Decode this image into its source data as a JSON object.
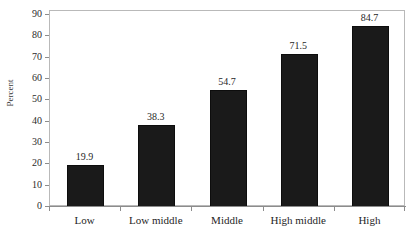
{
  "chart_data": {
    "type": "bar",
    "title": "",
    "subtitle": "",
    "categories": [
      "Low",
      "Low middle",
      "Middle",
      "High middle",
      "High"
    ],
    "values": [
      19.9,
      38.3,
      54.7,
      71.5,
      84.7
    ],
    "data_labels": [
      "19.9",
      "38.3",
      "54.7",
      "71.5",
      "84.7"
    ],
    "xlabel": "",
    "ylabel": "Percent",
    "ylim": [
      0,
      90
    ],
    "ytick_labels": [
      "0",
      "10",
      "20",
      "30",
      "40",
      "50",
      "60",
      "70",
      "80",
      "90"
    ],
    "ytick_values": [
      0,
      10,
      20,
      30,
      40,
      50,
      60,
      70,
      80,
      90
    ],
    "grid": false,
    "legend": null,
    "bar_color": "#1a1a1a",
    "background_color": "#ffffff",
    "frame_color": "#b9b9b9",
    "axis_color": "#8c8c8c"
  }
}
